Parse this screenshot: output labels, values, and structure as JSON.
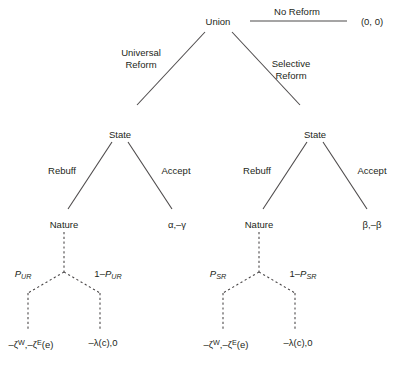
{
  "diagram": {
    "type": "extensive-form-game-tree",
    "nodes": {
      "root": "Union",
      "state_left": "State",
      "state_right": "State",
      "nature_left": "Nature",
      "nature_right": "Nature"
    },
    "edges": {
      "no_reform": "No Reform",
      "universal_reform": "Universal\nReform",
      "selective_reform": "Selective\nReform",
      "rebuff_left": "Rebuff",
      "accept_left": "Accept",
      "rebuff_right": "Rebuff",
      "accept_right": "Accept"
    },
    "probabilities": {
      "ur_left": {
        "base": "P",
        "sub": "UR"
      },
      "ur_right_prefix": "1–",
      "ur_right_base": "P",
      "ur_right_sub": "UR",
      "sr_left": {
        "base": "P",
        "sub": "SR"
      },
      "sr_right_prefix": "1–",
      "sr_right_base": "P",
      "sr_right_sub": "SR"
    },
    "payoffs": {
      "no_reform": "(0, 0)",
      "accept_left": "α,–γ",
      "accept_right": "β,–β",
      "terminal_ur_1_a": "–ζ",
      "terminal_ur_1_sup1": "W",
      "terminal_ur_1_b": ",–ζ",
      "terminal_ur_1_sup2": "E",
      "terminal_ur_1_c": "(e)",
      "terminal_ur_2": "–λ(c),0",
      "terminal_sr_1_a": "–ζ",
      "terminal_sr_1_sup1": "W",
      "terminal_sr_1_b": ",–ζ",
      "terminal_sr_1_sup2": "E",
      "terminal_sr_1_c": "(e)",
      "terminal_sr_2": "–λ(c),0"
    },
    "caption": "",
    "colors": {
      "line": "#4d4a4b",
      "text": "#231f20",
      "background": "#ffffff"
    }
  }
}
